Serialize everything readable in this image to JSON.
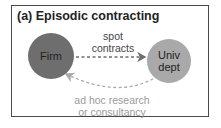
{
  "panel": {
    "title": "(a) Episodic contracting"
  },
  "nodes": {
    "firm": {
      "label": "Firm",
      "color": "#6e6e6e"
    },
    "univ": {
      "label_line1": "Univ",
      "label_line2": "dept",
      "color": "#a9a9a9"
    }
  },
  "edges": {
    "spot": {
      "line1": "spot",
      "line2": "contracts",
      "color": "#6e6e6e",
      "style": "dashed"
    },
    "adhoc": {
      "line1": "ad hoc research",
      "line2": "or consultancy",
      "color": "#a9a9a9",
      "style": "dashed"
    }
  }
}
